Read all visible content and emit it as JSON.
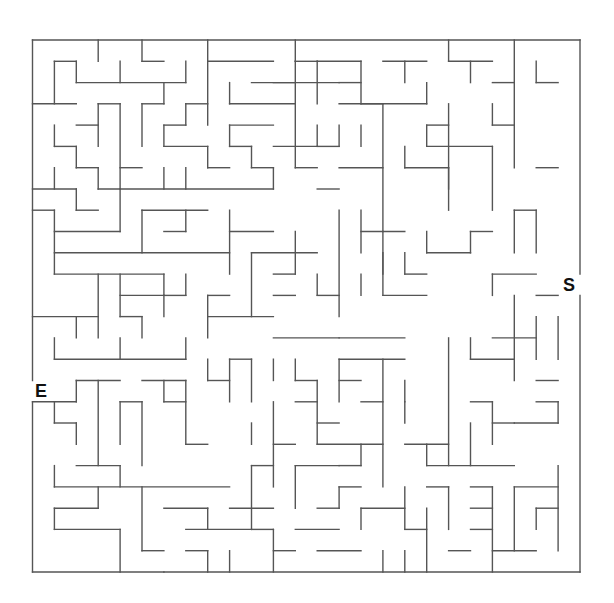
{
  "maze": {
    "cols": 25,
    "rows": 25,
    "origin_x": 32.5,
    "origin_y": 40,
    "cell_w": 21.9,
    "cell_h": 21.28,
    "wall_color": "#555555",
    "start_label": "S",
    "end_label": "E",
    "start_row": 11,
    "end_row": 16,
    "walls": [
      [
        0,
        0,
        25,
        0
      ],
      [
        0,
        25,
        25,
        25
      ],
      [
        0,
        0,
        0,
        16
      ],
      [
        0,
        17,
        0,
        25
      ],
      [
        25,
        0,
        25,
        11
      ],
      [
        25,
        12,
        25,
        25
      ],
      [
        3,
        0,
        3,
        1
      ],
      [
        5,
        0,
        5,
        1
      ],
      [
        5,
        1,
        6,
        1
      ],
      [
        8,
        0,
        8,
        4
      ],
      [
        8,
        1,
        11,
        1
      ],
      [
        1,
        1,
        2,
        1
      ],
      [
        1,
        1,
        1,
        3
      ],
      [
        2,
        1,
        2,
        2
      ],
      [
        2,
        2,
        7,
        2
      ],
      [
        4,
        1,
        4,
        2
      ],
      [
        7,
        1,
        7,
        2
      ],
      [
        0,
        3,
        2,
        3
      ],
      [
        6,
        2,
        6,
        3
      ],
      [
        5,
        3,
        6,
        3
      ],
      [
        5,
        3,
        5,
        5
      ],
      [
        3,
        3,
        4,
        3
      ],
      [
        3,
        3,
        3,
        5
      ],
      [
        4,
        3,
        4,
        7
      ],
      [
        2,
        4,
        3,
        4
      ],
      [
        1,
        4,
        1,
        5
      ],
      [
        1,
        5,
        2,
        5
      ],
      [
        2,
        5,
        2,
        6
      ],
      [
        2,
        6,
        3,
        6
      ],
      [
        3,
        6,
        3,
        7
      ],
      [
        7,
        3,
        8,
        3
      ],
      [
        7,
        3,
        7,
        4
      ],
      [
        6,
        4,
        7,
        4
      ],
      [
        6,
        4,
        6,
        5
      ],
      [
        6,
        5,
        8,
        5
      ],
      [
        8,
        5,
        8,
        6
      ],
      [
        8,
        6,
        9,
        6
      ],
      [
        9,
        2,
        9,
        3
      ],
      [
        9,
        3,
        12,
        3
      ],
      [
        12,
        1,
        12,
        6
      ],
      [
        12,
        1,
        13,
        1
      ],
      [
        10,
        2,
        12,
        2
      ],
      [
        9,
        4,
        11,
        4
      ],
      [
        9,
        4,
        9,
        5
      ],
      [
        9,
        5,
        10,
        5
      ],
      [
        10,
        5,
        10,
        6
      ],
      [
        10,
        6,
        11,
        6
      ],
      [
        11,
        6,
        11,
        7
      ],
      [
        11,
        5,
        13,
        5
      ],
      [
        12,
        6,
        13,
        6
      ],
      [
        4,
        6,
        5,
        6
      ],
      [
        6,
        6,
        6,
        7
      ],
      [
        7,
        6,
        7,
        7
      ],
      [
        3,
        7,
        11,
        7
      ],
      [
        1,
        6,
        1,
        7
      ],
      [
        0,
        7,
        2,
        7
      ],
      [
        12,
        0,
        12,
        1
      ],
      [
        13,
        1,
        15,
        1
      ],
      [
        13,
        1,
        13,
        3
      ],
      [
        14,
        2,
        15,
        2
      ],
      [
        15,
        1,
        15,
        3
      ],
      [
        15,
        3,
        16,
        3
      ],
      [
        11,
        2,
        14,
        2
      ],
      [
        16,
        1,
        18,
        1
      ],
      [
        17,
        1,
        17,
        2
      ],
      [
        14,
        3,
        18,
        3
      ],
      [
        18,
        2,
        18,
        3
      ],
      [
        19,
        0,
        19,
        1
      ],
      [
        19,
        1,
        21,
        1
      ],
      [
        20,
        1,
        20,
        2
      ],
      [
        21,
        2,
        22,
        2
      ],
      [
        22,
        0,
        22,
        6
      ],
      [
        21,
        3,
        21,
        4
      ],
      [
        21,
        4,
        22,
        4
      ],
      [
        16,
        3,
        16,
        9
      ],
      [
        19,
        3,
        19,
        7
      ],
      [
        18,
        4,
        19,
        4
      ],
      [
        18,
        4,
        18,
        5
      ],
      [
        18,
        5,
        21,
        5
      ],
      [
        21,
        5,
        21,
        8
      ],
      [
        17,
        5,
        17,
        6
      ],
      [
        17,
        6,
        19,
        6
      ],
      [
        19,
        6,
        19,
        8
      ],
      [
        23,
        1,
        23,
        2
      ],
      [
        23,
        2,
        24,
        2
      ],
      [
        23,
        6,
        24,
        6
      ],
      [
        14,
        4,
        14,
        5
      ],
      [
        13,
        5,
        14,
        5
      ],
      [
        13,
        4,
        13,
        5
      ],
      [
        15,
        4,
        15,
        5
      ],
      [
        14,
        6,
        16,
        6
      ],
      [
        0,
        8,
        1,
        8
      ],
      [
        1,
        8,
        1,
        11
      ],
      [
        1,
        9,
        4,
        9
      ],
      [
        4,
        7,
        4,
        9
      ],
      [
        2,
        8,
        3,
        8
      ],
      [
        2,
        7,
        2,
        8
      ],
      [
        5,
        8,
        5,
        10
      ],
      [
        5,
        8,
        8,
        8
      ],
      [
        7,
        8,
        7,
        9
      ],
      [
        6,
        9,
        7,
        9
      ],
      [
        9,
        8,
        9,
        11
      ],
      [
        9,
        9,
        11,
        9
      ],
      [
        1,
        10,
        9,
        10
      ],
      [
        1,
        11,
        6,
        11
      ],
      [
        6,
        11,
        6,
        12
      ],
      [
        6,
        12,
        7,
        12
      ],
      [
        7,
        11,
        7,
        12
      ],
      [
        3,
        11,
        3,
        14
      ],
      [
        4,
        11,
        4,
        13
      ],
      [
        4,
        12,
        6,
        12
      ],
      [
        6,
        12,
        6,
        13
      ],
      [
        0,
        13,
        3,
        13
      ],
      [
        2,
        13,
        2,
        14
      ],
      [
        4,
        13,
        5,
        13
      ],
      [
        5,
        13,
        5,
        14
      ],
      [
        1,
        14,
        1,
        15
      ],
      [
        1,
        15,
        7,
        15
      ],
      [
        7,
        14,
        7,
        15
      ],
      [
        8,
        12,
        9,
        12
      ],
      [
        8,
        12,
        8,
        14
      ],
      [
        8,
        13,
        11,
        13
      ],
      [
        11,
        14,
        14,
        14
      ],
      [
        10,
        10,
        10,
        13
      ],
      [
        10,
        10,
        13,
        10
      ],
      [
        12,
        9,
        12,
        11
      ],
      [
        11,
        12,
        12,
        12
      ],
      [
        13,
        11,
        13,
        12
      ],
      [
        13,
        12,
        14,
        12
      ],
      [
        14,
        14,
        17,
        14
      ],
      [
        4,
        14,
        4,
        15
      ],
      [
        11,
        11,
        12,
        11
      ],
      [
        14,
        8,
        14,
        13
      ],
      [
        13,
        7,
        14,
        7
      ],
      [
        15,
        9,
        17,
        9
      ],
      [
        15,
        8,
        15,
        10
      ],
      [
        16,
        9,
        16,
        12
      ],
      [
        16,
        12,
        18,
        12
      ],
      [
        16,
        10,
        16,
        11
      ],
      [
        17,
        11,
        18,
        11
      ],
      [
        18,
        9,
        18,
        10
      ],
      [
        18,
        10,
        20,
        10
      ],
      [
        20,
        9,
        20,
        10
      ],
      [
        20,
        9,
        21,
        9
      ],
      [
        22,
        8,
        22,
        10
      ],
      [
        22,
        8,
        23,
        8
      ],
      [
        23,
        8,
        23,
        10
      ],
      [
        21,
        11,
        23,
        11
      ],
      [
        21,
        11,
        21,
        12
      ],
      [
        15,
        11,
        15,
        12
      ],
      [
        17,
        10,
        17,
        11
      ],
      [
        2,
        16,
        2,
        17
      ],
      [
        0,
        17,
        2,
        17
      ],
      [
        2,
        16,
        4,
        16
      ],
      [
        1,
        17,
        1,
        18
      ],
      [
        1,
        18,
        2,
        18
      ],
      [
        2,
        18,
        2,
        19
      ],
      [
        3,
        16,
        3,
        20
      ],
      [
        4,
        17,
        5,
        17
      ],
      [
        4,
        17,
        4,
        19
      ],
      [
        5,
        17,
        5,
        20
      ],
      [
        5,
        16,
        7,
        16
      ],
      [
        6,
        16,
        6,
        17
      ],
      [
        6,
        17,
        7,
        17
      ],
      [
        7,
        16,
        7,
        19
      ],
      [
        8,
        15,
        8,
        16
      ],
      [
        8,
        16,
        9,
        16
      ],
      [
        9,
        15,
        9,
        17
      ],
      [
        7,
        19,
        8,
        19
      ],
      [
        2,
        20,
        4,
        20
      ],
      [
        4,
        20,
        4,
        21
      ],
      [
        1,
        21,
        9,
        21
      ],
      [
        1,
        20,
        1,
        21
      ],
      [
        1,
        22,
        3,
        22
      ],
      [
        3,
        21,
        3,
        22
      ],
      [
        1,
        23,
        4,
        23
      ],
      [
        1,
        22,
        1,
        23
      ],
      [
        4,
        23,
        4,
        25
      ],
      [
        5,
        21,
        5,
        24
      ],
      [
        5,
        24,
        6,
        24
      ],
      [
        6,
        22,
        8,
        22
      ],
      [
        8,
        22,
        8,
        23
      ],
      [
        7,
        23,
        10,
        23
      ],
      [
        9,
        24,
        9,
        25
      ],
      [
        10,
        20,
        11,
        20
      ],
      [
        10,
        20,
        10,
        23
      ],
      [
        10,
        23,
        11,
        23
      ],
      [
        9,
        22,
        11,
        22
      ],
      [
        11,
        17,
        11,
        21
      ],
      [
        11,
        19,
        12,
        19
      ],
      [
        12,
        15,
        12,
        16
      ],
      [
        12,
        16,
        13,
        16
      ],
      [
        13,
        16,
        13,
        19
      ],
      [
        12,
        17,
        13,
        17
      ],
      [
        13,
        18,
        14,
        18
      ],
      [
        13,
        19,
        16,
        19
      ],
      [
        14,
        20,
        15,
        20
      ],
      [
        15,
        19,
        15,
        20
      ],
      [
        9,
        15,
        10,
        15
      ],
      [
        10,
        15,
        10,
        17
      ],
      [
        11,
        15,
        11,
        16
      ],
      [
        10,
        18,
        10,
        19
      ],
      [
        14,
        15,
        17,
        15
      ],
      [
        14,
        15,
        14,
        17
      ],
      [
        14,
        16,
        15,
        16
      ],
      [
        15,
        17,
        16,
        17
      ],
      [
        17,
        17,
        17,
        18
      ],
      [
        16,
        15,
        16,
        21
      ],
      [
        17,
        16,
        17,
        17
      ],
      [
        17,
        19,
        19,
        19
      ],
      [
        18,
        19,
        18,
        20
      ],
      [
        19,
        14,
        19,
        20
      ],
      [
        20,
        14,
        20,
        15
      ],
      [
        20,
        15,
        22,
        15
      ],
      [
        21,
        14,
        23,
        14
      ],
      [
        22,
        12,
        22,
        16
      ],
      [
        23,
        16,
        24,
        16
      ],
      [
        22,
        18,
        24,
        18
      ],
      [
        20,
        17,
        21,
        17
      ],
      [
        21,
        17,
        21,
        19
      ],
      [
        21,
        18,
        22,
        18
      ],
      [
        23,
        12,
        24,
        12
      ],
      [
        23,
        13,
        23,
        15
      ],
      [
        24,
        13,
        24,
        15
      ],
      [
        23,
        17,
        24,
        17
      ],
      [
        24,
        17,
        24,
        18
      ],
      [
        20,
        18,
        20,
        20
      ],
      [
        12,
        20,
        12,
        22
      ],
      [
        12,
        20,
        14,
        20
      ],
      [
        14,
        21,
        15,
        21
      ],
      [
        13,
        22,
        14,
        22
      ],
      [
        14,
        21,
        14,
        22
      ],
      [
        12,
        23,
        14,
        23
      ],
      [
        13,
        24,
        15,
        24
      ],
      [
        15,
        22,
        17,
        22
      ],
      [
        15,
        22,
        15,
        23
      ],
      [
        17,
        21,
        17,
        23
      ],
      [
        17,
        23,
        18,
        23
      ],
      [
        16,
        24,
        16,
        25
      ],
      [
        18,
        20,
        22,
        20
      ],
      [
        18,
        21,
        19,
        21
      ],
      [
        19,
        21,
        19,
        23
      ],
      [
        20,
        22,
        21,
        22
      ],
      [
        21,
        21,
        21,
        25
      ],
      [
        20,
        21,
        21,
        21
      ],
      [
        22,
        21,
        24,
        21
      ],
      [
        22,
        21,
        22,
        24
      ],
      [
        23,
        22,
        24,
        22
      ],
      [
        23,
        22,
        23,
        23
      ],
      [
        24,
        20,
        24,
        24
      ],
      [
        21,
        24,
        23,
        24
      ],
      [
        18,
        22,
        18,
        25
      ],
      [
        19,
        24,
        20,
        24
      ],
      [
        17,
        24,
        17,
        25
      ],
      [
        20,
        23,
        21,
        23
      ],
      [
        11,
        24,
        12,
        24
      ],
      [
        11,
        23,
        11,
        25
      ],
      [
        7,
        24,
        8,
        24
      ],
      [
        8,
        24,
        8,
        25
      ],
      [
        6,
        25,
        6,
        25
      ]
    ]
  }
}
